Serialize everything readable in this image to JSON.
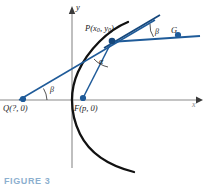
{
  "figure": {
    "caption": "FIGURE 3",
    "axes": {
      "x_label": "x",
      "y_label": "y",
      "origin": [
        72,
        100
      ],
      "x_axis_color": "#8a8a8a",
      "y_axis_color": "#8a8a8a"
    },
    "colors": {
      "curve": "#111111",
      "line_blue": "#1f5b99",
      "point_blue": "#1f5b99",
      "axis_gray": "#8a8a8a",
      "caption_blue": "#2e6fa8",
      "background": "#ffffff"
    },
    "points": [
      {
        "name": "Q",
        "label": "Q(?, 0)",
        "x": 23,
        "y": 99
      },
      {
        "name": "F",
        "label": "F(p, 0)",
        "x": 83,
        "y": 98
      },
      {
        "name": "P",
        "label_prefix": "P(x",
        "label_sub1": "0",
        "label_mid": ", y",
        "label_sub2": "0",
        "label_suffix": ")",
        "x": 112,
        "y": 41
      },
      {
        "name": "G",
        "label": "G",
        "x": 178,
        "y": 35
      }
    ],
    "angles": [
      {
        "name": "beta-at-Q",
        "label": "β",
        "vertex": "Q"
      },
      {
        "name": "alpha-at-P",
        "label": "α",
        "vertex": "P"
      },
      {
        "name": "beta-at-P",
        "label": "β",
        "vertex": "P"
      }
    ],
    "curve": {
      "type": "parabola",
      "opens": "right",
      "vertex": [
        72,
        100
      ]
    },
    "segments": [
      {
        "name": "tangent-line-Q-to-P",
        "from": "Q",
        "to": "P"
      },
      {
        "name": "focal-radius-F-to-P",
        "from": "F",
        "to": "P"
      },
      {
        "name": "horizontal-ray-P-to-G",
        "from": "P",
        "to": "G"
      }
    ]
  }
}
